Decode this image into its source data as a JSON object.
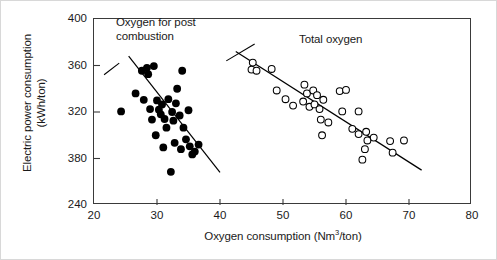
{
  "axes": {
    "x_title_prefix": "Oxygen consumption (Nm",
    "x_title_sup": "3",
    "x_title_suffix": "/ton)",
    "y_title_line1": "Electric power consumption",
    "y_title_line2": "(kWh/ton)"
  },
  "annotations": {
    "black_line1": "Oxygen for post",
    "black_line2": "combustion",
    "open_label": "Total oxygen"
  },
  "chart_data": {
    "type": "scatter",
    "title": "",
    "xlabel": "Oxygen consumption (Nm3/ton)",
    "ylabel": "Electric power consumption (kWh/ton)",
    "xlim": [
      20,
      80
    ],
    "ylim": [
      240,
      400
    ],
    "xticks": [
      20,
      30,
      40,
      50,
      60,
      70,
      80
    ],
    "xtick_labels": [
      "20",
      "30",
      "40",
      "50",
      "60",
      "70",
      "80"
    ],
    "yticks": [
      240,
      280,
      320,
      360,
      400
    ],
    "ytick_labels": [
      "240",
      "380",
      "320",
      "360",
      "400"
    ],
    "ytick_labels_note": "Label at the 280 gridline is printed as 380 in the source figure",
    "grid": false,
    "legend": "inline annotations",
    "series": [
      {
        "name": "Oxygen for post combustion",
        "marker": "filled-circle",
        "color": "#000000",
        "points": [
          [
            24.3,
            320.5
          ],
          [
            26.6,
            336.0
          ],
          [
            27.6,
            355.5
          ],
          [
            28.4,
            358.0
          ],
          [
            28.6,
            352.5
          ],
          [
            29.5,
            359.5
          ],
          [
            27.9,
            330.5
          ],
          [
            28.9,
            322.5
          ],
          [
            29.2,
            313.5
          ],
          [
            30.0,
            330.0
          ],
          [
            30.3,
            322.0
          ],
          [
            30.6,
            318.0
          ],
          [
            30.8,
            326.5
          ],
          [
            31.2,
            314.0
          ],
          [
            31.5,
            306.5
          ],
          [
            29.8,
            300.0
          ],
          [
            31.8,
            331.0
          ],
          [
            32.4,
            320.0
          ],
          [
            32.6,
            312.5
          ],
          [
            33.2,
            340.0
          ],
          [
            33.0,
            327.5
          ],
          [
            33.6,
            317.0
          ],
          [
            34.2,
            306.5
          ],
          [
            31.0,
            289.5
          ],
          [
            32.8,
            293.5
          ],
          [
            33.8,
            288.0
          ],
          [
            34.6,
            296.5
          ],
          [
            35.2,
            290.5
          ],
          [
            35.6,
            283.5
          ],
          [
            36.0,
            286.0
          ],
          [
            34.0,
            355.5
          ],
          [
            35.0,
            321.5
          ],
          [
            36.6,
            292.0
          ],
          [
            32.2,
            268.5
          ]
        ],
        "trend_line": {
          "x": [
            25.5,
            40.0
          ],
          "y": [
            368.0,
            268.0
          ]
        }
      },
      {
        "name": "Total oxygen",
        "marker": "open-circle",
        "color": "#000000",
        "points": [
          [
            45.2,
            362.5
          ],
          [
            45.0,
            356.5
          ],
          [
            45.8,
            355.5
          ],
          [
            48.2,
            357.0
          ],
          [
            49.0,
            338.5
          ],
          [
            50.4,
            331.0
          ],
          [
            51.6,
            325.5
          ],
          [
            53.4,
            343.5
          ],
          [
            53.8,
            336.0
          ],
          [
            53.2,
            329.0
          ],
          [
            54.2,
            324.5
          ],
          [
            54.8,
            338.5
          ],
          [
            55.4,
            334.5
          ],
          [
            55.0,
            326.5
          ],
          [
            55.8,
            322.5
          ],
          [
            56.4,
            330.5
          ],
          [
            56.0,
            313.5
          ],
          [
            57.2,
            311.0
          ],
          [
            59.0,
            338.0
          ],
          [
            60.0,
            339.0
          ],
          [
            59.4,
            320.5
          ],
          [
            62.0,
            320.5
          ],
          [
            61.0,
            305.5
          ],
          [
            62.0,
            301.0
          ],
          [
            63.2,
            303.0
          ],
          [
            63.4,
            295.5
          ],
          [
            64.4,
            298.0
          ],
          [
            63.0,
            288.0
          ],
          [
            62.6,
            279.0
          ],
          [
            56.2,
            300.0
          ],
          [
            67.0,
            295.0
          ],
          [
            69.2,
            295.5
          ],
          [
            67.4,
            285.0
          ]
        ],
        "trend_line": {
          "x": [
            42.5,
            72.0
          ],
          "y": [
            372.0,
            270.0
          ]
        }
      }
    ]
  }
}
